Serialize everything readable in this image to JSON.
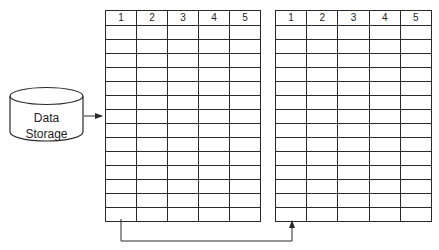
{
  "storage": {
    "label_line1": "Data",
    "label_line2": "Storage"
  },
  "tables": [
    {
      "id": "left",
      "columns": [
        "1",
        "2",
        "3",
        "4",
        "5"
      ],
      "row_count": 14
    },
    {
      "id": "right",
      "columns": [
        "1",
        "2",
        "3",
        "4",
        "5"
      ],
      "row_count": 14
    }
  ],
  "connectors": [
    {
      "from": "data-storage",
      "to": "left-table"
    },
    {
      "from": "left-table",
      "to": "right-table"
    }
  ],
  "colors": {
    "stroke": "#2a2a2a",
    "background": "#ffffff"
  }
}
